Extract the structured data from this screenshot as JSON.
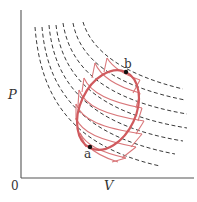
{
  "diagram": {
    "type": "PV-diagram",
    "axes": {
      "y_label": "P",
      "x_label": "V",
      "origin_label": "0"
    },
    "points": [
      {
        "label": "a"
      },
      {
        "label": "b"
      }
    ],
    "elements": {
      "isotherms": "dashed-black-hyperbolas",
      "cycle": "red-ellipse",
      "approximation": "red-zigzag-isotherm-adiabat-segments"
    },
    "colors": {
      "cycle": "#d05a5e",
      "zigzag": "#d9777a",
      "isotherm": "#222222",
      "axis": "#555555"
    }
  }
}
